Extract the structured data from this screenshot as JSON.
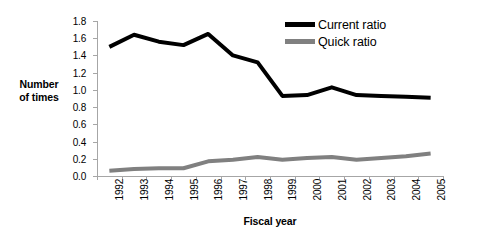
{
  "chart_data": {
    "type": "line",
    "title": "",
    "xlabel": "Fiscal year",
    "ylabel": "Number of times",
    "ylabel_line1": "Number",
    "ylabel_line2": "of times",
    "categories": [
      "1992",
      "1993",
      "1994",
      "1995",
      "1996",
      "1997",
      "1998",
      "1999",
      "2000",
      "2001",
      "2002",
      "2003",
      "2004",
      "2005"
    ],
    "ylim": [
      0.0,
      1.8
    ],
    "yticks": [
      "0.0",
      "0.2",
      "0.4",
      "0.6",
      "0.8",
      "1.0",
      "1.2",
      "1.4",
      "1.6",
      "1.8"
    ],
    "ytick_values": [
      0.0,
      0.2,
      0.4,
      0.6,
      0.8,
      1.0,
      1.2,
      1.4,
      1.6,
      1.8
    ],
    "grid": false,
    "legend_position": "top-right",
    "series": [
      {
        "name": "Current ratio",
        "color": "#000000",
        "values": [
          1.5,
          1.64,
          1.56,
          1.52,
          1.65,
          1.4,
          1.32,
          0.93,
          0.94,
          1.03,
          0.94,
          0.93,
          0.92,
          0.91
        ]
      },
      {
        "name": "Quick ratio",
        "color": "#808080",
        "values": [
          0.06,
          0.08,
          0.09,
          0.09,
          0.17,
          0.19,
          0.22,
          0.19,
          0.21,
          0.22,
          0.19,
          0.21,
          0.23,
          0.26
        ]
      }
    ]
  },
  "colors": {
    "current_ratio": "#000000",
    "quick_ratio": "#808080",
    "axis": "#a6a6a6",
    "background": "#ffffff"
  }
}
